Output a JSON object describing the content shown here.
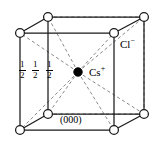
{
  "figure": {
    "type": "crystal-structure-unit-cell",
    "background_color": "#ffffff",
    "line_color": "#1a1a1a",
    "dashed_color": "#8a8a8a",
    "atom_fill_open": "#ffffff",
    "atom_fill_solid": "#000000"
  },
  "labels": {
    "anion": {
      "symbol": "Cl",
      "charge": "−",
      "full": "Cl−",
      "x": 120,
      "y": 38
    },
    "cation": {
      "symbol": "Cs",
      "charge": "+",
      "full": "Cs+",
      "x": 89,
      "y": 66
    },
    "origin": {
      "text": "(000)",
      "x": 60,
      "y": 115
    },
    "fractions": [
      {
        "numerator": "1",
        "denominator": "2",
        "x": 19,
        "y": 60
      },
      {
        "numerator": "1",
        "denominator": "2",
        "x": 32,
        "y": 60
      },
      {
        "numerator": "1",
        "denominator": "2",
        "x": 46,
        "y": 60
      }
    ]
  },
  "geometry": {
    "front_face": {
      "top_left": {
        "x": 20,
        "y": 33
      },
      "top_right": {
        "x": 114,
        "y": 33
      },
      "bottom_right": {
        "x": 114,
        "y": 130
      },
      "bottom_left": {
        "x": 20,
        "y": 130
      }
    },
    "back_face": {
      "top_left": {
        "x": 48,
        "y": 17
      },
      "top_right": {
        "x": 144,
        "y": 17
      },
      "bottom_right": {
        "x": 144,
        "y": 114
      },
      "bottom_left": {
        "x": 48,
        "y": 114
      }
    },
    "body_center": {
      "x": 78,
      "y": 72
    },
    "corner_radius": 4.4,
    "center_radius": 4.2
  },
  "atoms": {
    "corner_ion": "Cl−",
    "corner_count": 8,
    "center_ion": "Cs+",
    "center_count": 1
  }
}
